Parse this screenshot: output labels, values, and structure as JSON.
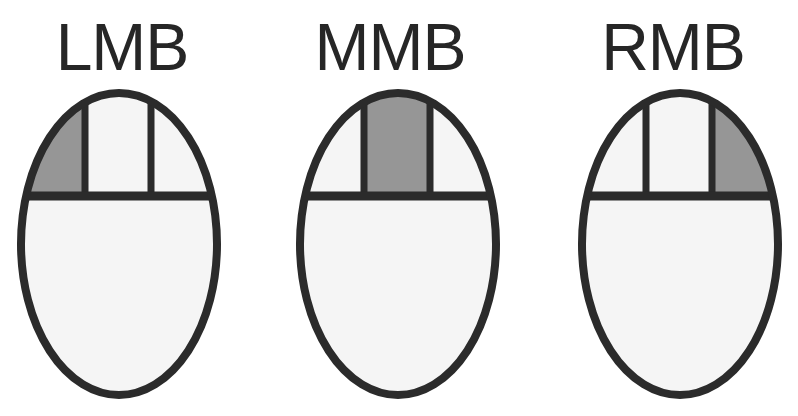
{
  "diagram": {
    "colors": {
      "outline": "#2b2b2b",
      "body_fill": "#f5f5f5",
      "button_fill": "#f5f5f5",
      "highlight_fill": "#969696",
      "label_text": "#262626",
      "background": "#ffffff"
    },
    "geometry": {
      "ellipse_width": 196,
      "ellipse_height": 302,
      "divider_y_fraction": 0.355,
      "button_split_left_fraction": 0.34,
      "button_split_right_fraction": 0.655,
      "stroke_width": 7
    },
    "figures": [
      {
        "id": "lmb",
        "label": "LMB",
        "name": "left-mouse-button",
        "highlighted_button": "left",
        "buttons": [
          {
            "name": "left-button",
            "highlighted": true
          },
          {
            "name": "middle-button",
            "highlighted": false
          },
          {
            "name": "right-button",
            "highlighted": false
          }
        ]
      },
      {
        "id": "mmb",
        "label": "MMB",
        "name": "middle-mouse-button",
        "highlighted_button": "middle",
        "buttons": [
          {
            "name": "left-button",
            "highlighted": false
          },
          {
            "name": "middle-button",
            "highlighted": true
          },
          {
            "name": "right-button",
            "highlighted": false
          }
        ]
      },
      {
        "id": "rmb",
        "label": "RMB",
        "name": "right-mouse-button",
        "highlighted_button": "right",
        "buttons": [
          {
            "name": "left-button",
            "highlighted": false
          },
          {
            "name": "middle-button",
            "highlighted": false
          },
          {
            "name": "right-button",
            "highlighted": true
          }
        ]
      }
    ]
  }
}
